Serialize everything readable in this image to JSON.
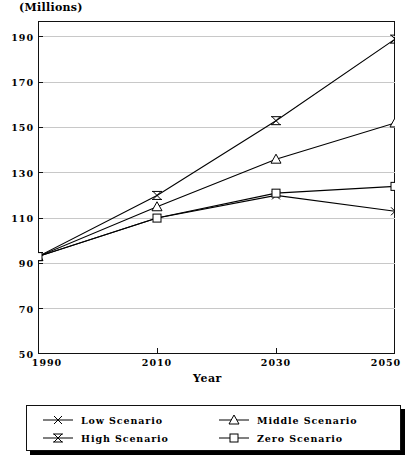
{
  "chart_data": {
    "type": "line",
    "title": "",
    "unit_caption": "(Millions)",
    "xlabel": "Year",
    "ylabel": "",
    "x": [
      1990,
      2010,
      2030,
      2050
    ],
    "xtick_labels": [
      "1990",
      "2010",
      "2030",
      "2050"
    ],
    "ytick_labels": [
      "190",
      "170",
      "150",
      "130",
      "110",
      "90",
      "70",
      "50"
    ],
    "ytick_values": [
      190,
      170,
      150,
      130,
      110,
      90,
      70,
      50
    ],
    "xlim": [
      1990,
      2050
    ],
    "ylim": [
      50,
      197
    ],
    "grid": true,
    "legend_position": "below",
    "series": [
      {
        "name": "Low Scenario",
        "marker": "x-marker",
        "values": [
          93,
          110,
          120,
          113
        ]
      },
      {
        "name": "High Scenario",
        "marker": "star-marker",
        "values": [
          93,
          120,
          153,
          189
        ]
      },
      {
        "name": "Middle Scenario",
        "marker": "triangle-marker",
        "values": [
          93,
          115,
          136,
          152
        ]
      },
      {
        "name": "Zero Scenario",
        "marker": "square-marker",
        "values": [
          93,
          110,
          121,
          124
        ]
      }
    ]
  },
  "legend": {
    "entries": [
      {
        "label": "Low Scenario",
        "marker": "x-marker"
      },
      {
        "label": "High Scenario",
        "marker": "star-marker"
      },
      {
        "label": "Middle Scenario",
        "marker": "triangle-marker"
      },
      {
        "label": "Zero Scenario",
        "marker": "square-marker"
      }
    ]
  },
  "colors": {
    "line": "#000000",
    "grid": "#c8c8c8",
    "frame": "#111111",
    "background": "#ffffff"
  }
}
